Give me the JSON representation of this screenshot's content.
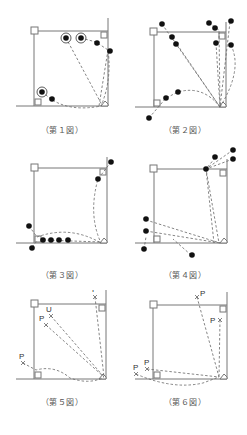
{
  "figures": [
    {
      "id": 1,
      "caption": "（第１図）"
    },
    {
      "id": 2,
      "caption": "（第２図）"
    },
    {
      "id": 3,
      "caption": "（第３図）"
    },
    {
      "id": 4,
      "caption": "（第４図）"
    },
    {
      "id": 5,
      "caption": "（第５図）"
    },
    {
      "id": 6,
      "caption": "（第６図）"
    }
  ],
  "labels": {
    "p": "P",
    "u": "U"
  },
  "colors": {
    "line": "#777777",
    "dash": "#666666",
    "dot": "#111111",
    "text": "#333333"
  }
}
